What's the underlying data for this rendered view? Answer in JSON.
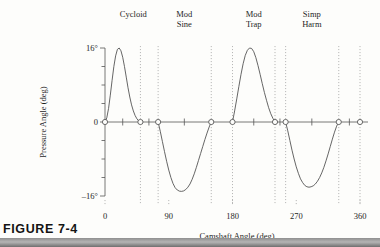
{
  "figure": {
    "caption": "FIGURE 7-4"
  },
  "chart_data": {
    "type": "line",
    "title": "",
    "xlabel": "Camshaft Angle (deg)",
    "ylabel": "Pressure Angle (deg)",
    "xlim": [
      0,
      360
    ],
    "ylim": [
      -16,
      16
    ],
    "xticks": [
      0,
      90,
      180,
      270,
      360
    ],
    "xtick_labels": [
      "0",
      "90",
      "180",
      "270",
      "360"
    ],
    "yticks": [
      -16,
      0,
      16
    ],
    "ytick_labels": [
      "–16°",
      "0",
      "16°"
    ],
    "grid": "vertical-dotted-at-segment-boundaries",
    "legend": "none",
    "segment_labels": [
      "Cycloid",
      "Mod Sine",
      "Mod Trap",
      "Simp Harm"
    ],
    "segment_label_lines": [
      [
        "Cycloid"
      ],
      [
        "Mod",
        "Sine"
      ],
      [
        "Mod",
        "Trap"
      ],
      [
        "Simp",
        "Harm"
      ]
    ],
    "gridline_x": [
      50,
      75,
      150,
      180,
      240,
      255,
      330,
      360
    ],
    "marker_x": [
      0,
      50,
      75,
      150,
      180,
      240,
      255,
      330,
      360
    ],
    "zero_tick_x": [
      25,
      62,
      112,
      210,
      247,
      292,
      345
    ],
    "segments": [
      {
        "name": "Cycloid",
        "x_start": 0,
        "x_end": 50,
        "peak_value": 16,
        "peak_x": 20,
        "label_x": 40,
        "points": [
          [
            0,
            0
          ],
          [
            2.5,
            0.9
          ],
          [
            5,
            2.9
          ],
          [
            7.5,
            5.8
          ],
          [
            10,
            9.0
          ],
          [
            12.5,
            12.0
          ],
          [
            15,
            14.3
          ],
          [
            17.5,
            15.7
          ],
          [
            20,
            16.0
          ],
          [
            22.5,
            15.4
          ],
          [
            25,
            14.0
          ],
          [
            27.5,
            12.0
          ],
          [
            30,
            9.7
          ],
          [
            32.5,
            7.4
          ],
          [
            35,
            5.4
          ],
          [
            37.5,
            3.7
          ],
          [
            40,
            2.4
          ],
          [
            42.5,
            1.4
          ],
          [
            45,
            0.7
          ],
          [
            47.5,
            0.25
          ],
          [
            50,
            0
          ]
        ]
      },
      {
        "name": "Mod Sine",
        "x_start": 75,
        "x_end": 150,
        "peak_value": -15,
        "peak_x": 113,
        "label_x": 112,
        "points": [
          [
            75,
            0
          ],
          [
            78,
            -2.0
          ],
          [
            81,
            -4.2
          ],
          [
            84,
            -6.4
          ],
          [
            87,
            -8.5
          ],
          [
            90,
            -10.4
          ],
          [
            93,
            -12.0
          ],
          [
            96,
            -13.3
          ],
          [
            99,
            -14.2
          ],
          [
            102,
            -14.7
          ],
          [
            105,
            -14.95
          ],
          [
            108,
            -15.0
          ],
          [
            111,
            -14.9
          ],
          [
            114,
            -14.6
          ],
          [
            117,
            -14.1
          ],
          [
            120,
            -13.4
          ],
          [
            123,
            -12.4
          ],
          [
            126,
            -11.2
          ],
          [
            129,
            -9.8
          ],
          [
            132,
            -8.3
          ],
          [
            135,
            -6.8
          ],
          [
            138,
            -5.3
          ],
          [
            141,
            -3.8
          ],
          [
            144,
            -2.4
          ],
          [
            147,
            -1.1
          ],
          [
            150,
            0
          ]
        ]
      },
      {
        "name": "Mod Trap",
        "x_start": 180,
        "x_end": 240,
        "peak_value": 16,
        "peak_x": 205,
        "label_x": 210,
        "points": [
          [
            180,
            0
          ],
          [
            183,
            2.4
          ],
          [
            186,
            5.0
          ],
          [
            189,
            7.7
          ],
          [
            192,
            10.3
          ],
          [
            195,
            12.6
          ],
          [
            198,
            14.4
          ],
          [
            201,
            15.5
          ],
          [
            204,
            16.0
          ],
          [
            207,
            15.9
          ],
          [
            210,
            15.2
          ],
          [
            213,
            13.9
          ],
          [
            216,
            12.2
          ],
          [
            219,
            10.3
          ],
          [
            222,
            8.3
          ],
          [
            225,
            6.4
          ],
          [
            228,
            4.7
          ],
          [
            231,
            3.1
          ],
          [
            234,
            1.8
          ],
          [
            237,
            0.8
          ],
          [
            240,
            0
          ]
        ]
      },
      {
        "name": "Simp Harm",
        "x_start": 255,
        "x_end": 330,
        "peak_value": -14,
        "peak_x": 292,
        "label_x": 292,
        "points": [
          [
            255,
            0
          ],
          [
            258,
            -1.9
          ],
          [
            261,
            -4.0
          ],
          [
            264,
            -6.1
          ],
          [
            267,
            -8.0
          ],
          [
            270,
            -9.7
          ],
          [
            273,
            -11.1
          ],
          [
            276,
            -12.3
          ],
          [
            279,
            -13.1
          ],
          [
            282,
            -13.7
          ],
          [
            285,
            -14.0
          ],
          [
            288,
            -14.1
          ],
          [
            291,
            -14.0
          ],
          [
            294,
            -13.8
          ],
          [
            297,
            -13.4
          ],
          [
            300,
            -12.8
          ],
          [
            303,
            -12.0
          ],
          [
            306,
            -11.0
          ],
          [
            309,
            -9.8
          ],
          [
            312,
            -8.4
          ],
          [
            315,
            -6.9
          ],
          [
            318,
            -5.3
          ],
          [
            321,
            -3.7
          ],
          [
            324,
            -2.2
          ],
          [
            327,
            -0.9
          ],
          [
            330,
            0
          ]
        ]
      }
    ]
  }
}
